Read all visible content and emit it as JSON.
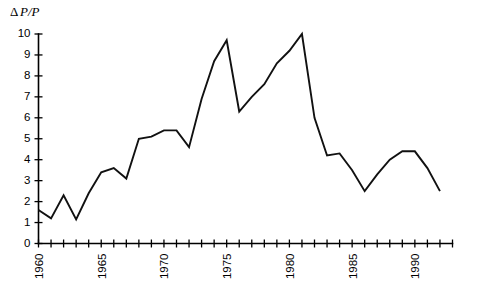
{
  "chart_data": {
    "type": "line",
    "title": "",
    "subtitle": "",
    "ylabel": "ΔP/P",
    "xlabel": "",
    "ylim": [
      0,
      10
    ],
    "xlim": [
      1960,
      1993
    ],
    "grid": false,
    "legend": "none",
    "y_ticks": [
      0,
      1,
      2,
      3,
      4,
      5,
      6,
      7,
      8,
      9,
      10
    ],
    "y_tick_labels": [
      "0",
      "1",
      "2",
      "3",
      "4",
      "5",
      "6",
      "7",
      "8",
      "9",
      "10"
    ],
    "x_ticks": [
      1960,
      1961,
      1962,
      1963,
      1964,
      1965,
      1966,
      1967,
      1968,
      1969,
      1970,
      1971,
      1972,
      1973,
      1974,
      1975,
      1976,
      1977,
      1978,
      1979,
      1980,
      1981,
      1982,
      1983,
      1984,
      1985,
      1986,
      1987,
      1988,
      1989,
      1990,
      1991,
      1992,
      1993
    ],
    "x_tick_labels": [
      "1960",
      "1965",
      "1970",
      "1975",
      "1980",
      "1985",
      "1990"
    ],
    "x_tick_label_years": [
      1960,
      1965,
      1970,
      1975,
      1980,
      1985,
      1990
    ],
    "x_tick_label_rotation": -90,
    "series": [
      {
        "name": "ΔP/P",
        "color": "#111111",
        "x": [
          1960,
          1961,
          1962,
          1963,
          1964,
          1965,
          1966,
          1967,
          1968,
          1969,
          1970,
          1971,
          1972,
          1973,
          1974,
          1975,
          1976,
          1977,
          1978,
          1979,
          1980,
          1981,
          1982,
          1983,
          1984,
          1985,
          1986,
          1987,
          1988,
          1989,
          1990,
          1991,
          1992
        ],
        "values": [
          1.6,
          1.2,
          2.3,
          1.15,
          2.4,
          3.4,
          3.6,
          3.1,
          5.0,
          5.1,
          5.4,
          5.4,
          4.6,
          6.9,
          8.7,
          9.7,
          6.3,
          7.0,
          7.6,
          8.6,
          9.2,
          10.0,
          6.0,
          4.2,
          4.3,
          3.5,
          2.5,
          3.3,
          4.0,
          4.4,
          4.4,
          3.6,
          2.5
        ]
      }
    ]
  },
  "axis": {
    "y_title_delta": "Δ",
    "y_title_rest": "P/P"
  }
}
